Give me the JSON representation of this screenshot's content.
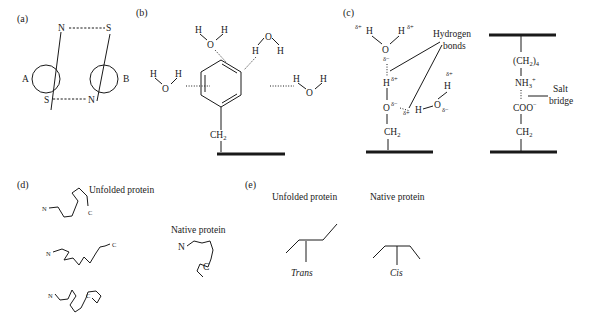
{
  "panels": {
    "a": {
      "label": "(a)",
      "dipole_A_label": "A",
      "dipole_B_label": "B",
      "poles": {
        "top_left": "N",
        "top_right": "S",
        "bottom_left": "S",
        "bottom_right": "N"
      }
    },
    "b": {
      "label": "(b)",
      "water_atoms": {
        "H": "H",
        "O": "O"
      },
      "linker": "CH",
      "linker_sub": "2"
    },
    "c": {
      "label": "(c)",
      "delta_plus": "δ+",
      "delta_minus": "δ−",
      "hydrogen_bonds_line1": "Hydrogen",
      "hydrogen_bonds_line2": "bonds",
      "atoms": {
        "H": "H",
        "O": "O"
      },
      "linker": "CH",
      "linker_sub": "2",
      "salt_bridge": {
        "chain_top": "(CH",
        "chain_top_sub": "2",
        "chain_top_close": ")",
        "chain_top_count": "4",
        "amine": "NH",
        "amine_sub": "3",
        "amine_charge": "+",
        "carboxyl": "COO",
        "carboxyl_charge": "−",
        "linker": "CH",
        "linker_sub": "2",
        "label_line1": "Salt",
        "label_line2": "bridge"
      }
    },
    "d": {
      "label": "(d)",
      "unfolded_label": "Unfolded protein",
      "native_label": "Native protein",
      "n_terminus": "N",
      "c_terminus": "C"
    },
    "e": {
      "label": "(e)",
      "unfolded_label": "Unfolded protein",
      "native_label": "Native protein",
      "trans_label": "Trans",
      "cis_label": "Cis"
    }
  }
}
